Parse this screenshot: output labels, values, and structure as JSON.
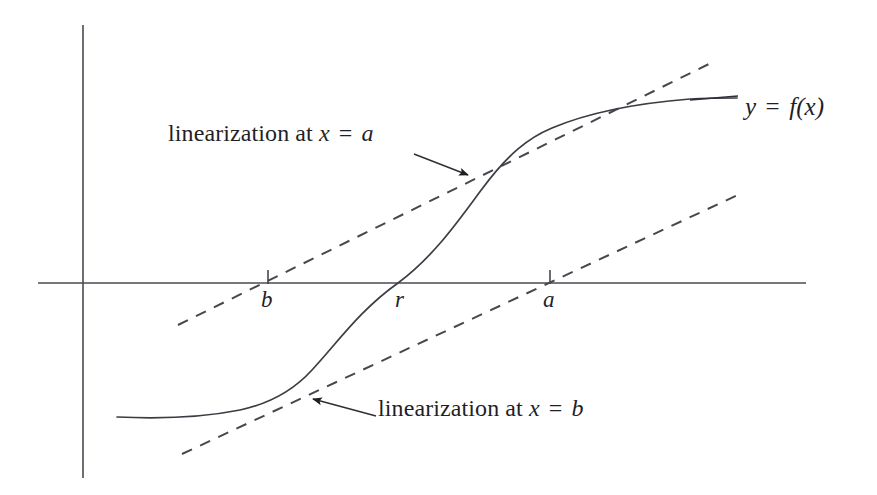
{
  "figure": {
    "type": "math-diagram",
    "background_color": "#ffffff",
    "stroke_color": "#3c3c44"
  },
  "axes": {
    "x_axis_name": "x-axis",
    "y_axis_name": "y-axis",
    "x_axis": {
      "x1": 38,
      "y1": 283,
      "x2": 806,
      "y2": 283
    },
    "y_axis": {
      "x1": 83,
      "y1": 25,
      "x2": 83,
      "y2": 478
    },
    "ticks": [
      {
        "label": "b",
        "x": 268,
        "label_x": 261,
        "label_y": 288
      },
      {
        "label": "a",
        "x": 550,
        "label_x": 543,
        "label_y": 288
      }
    ],
    "root_label": {
      "label": "r",
      "label_x": 395,
      "label_y": 288
    }
  },
  "curve": {
    "name": "function-curve",
    "label_lhs": "y",
    "label_eq": "=",
    "label_rhs": "f(x)",
    "label_full": "y = f(x)",
    "label_x": 745,
    "label_y": 94,
    "leader_x1": 690,
    "leader_y1": 100,
    "leader_x2": 738,
    "leader_y2": 96,
    "path": "M 117 417 C 160 419 205 417 240 410 C 268 404 292 392 312 370 C 338 342 360 310 398 283 C 432 258 458 222 482 189 C 508 154 528 138 552 128 C 590 112 640 103 690 99 C 708 98 722 98 737 98"
  },
  "tangent_a": {
    "name": "tangent-line-at-a",
    "annotation": "linearization at x = a",
    "annotation_prefix": "linearization at",
    "annotation_var": "x",
    "annotation_eq": "=",
    "annotation_point": "a",
    "annotation_x": 168,
    "annotation_y": 121,
    "line": {
      "x1": 178,
      "y1": 325,
      "x2": 713,
      "y2": 62
    },
    "pointer": {
      "x1": 414,
      "y1": 154,
      "x2": 468,
      "y2": 175
    }
  },
  "tangent_b": {
    "name": "tangent-line-at-b",
    "annotation": "linearization at x = b",
    "annotation_prefix": "linearization at",
    "annotation_var": "x",
    "annotation_eq": "=",
    "annotation_point": "b",
    "annotation_x": 378,
    "annotation_y": 396,
    "line": {
      "x1": 182,
      "y1": 454,
      "x2": 742,
      "y2": 193
    },
    "pointer": {
      "x1": 376,
      "y1": 416,
      "x2": 313,
      "y2": 399
    }
  },
  "chart_data": {
    "type": "line",
    "xlabel": "x",
    "ylabel": "y",
    "grid": false,
    "legend": "none",
    "annotations": [
      "linearization at x = a",
      "linearization at x = b",
      "y = f(x)",
      "b",
      "r",
      "a"
    ],
    "series": [
      {
        "name": "y = f(x)",
        "style": "solid",
        "x": [
          117,
          160,
          205,
          240,
          268,
          292,
          312,
          338,
          360,
          398,
          432,
          458,
          482,
          508,
          528,
          552,
          590,
          640,
          690,
          737
        ],
        "y": [
          417,
          419,
          417,
          410,
          404,
          392,
          370,
          342,
          310,
          283,
          258,
          222,
          189,
          154,
          138,
          128,
          112,
          103,
          99,
          98
        ]
      },
      {
        "name": "linearization at x = a",
        "style": "dashed",
        "x": [
          178,
          713
        ],
        "y": [
          325,
          62
        ]
      },
      {
        "name": "linearization at x = b",
        "style": "dashed",
        "x": [
          182,
          742
        ],
        "y": [
          454,
          193
        ]
      }
    ],
    "marked_points": [
      {
        "label": "b",
        "x": 268,
        "y": 283,
        "note": "tangency abscissa for lower linearization"
      },
      {
        "label": "r",
        "x": 398,
        "y": 283,
        "note": "root of f, where curve crosses x-axis"
      },
      {
        "label": "a",
        "x": 550,
        "y": 283,
        "note": "tangency abscissa for upper linearization"
      }
    ]
  }
}
